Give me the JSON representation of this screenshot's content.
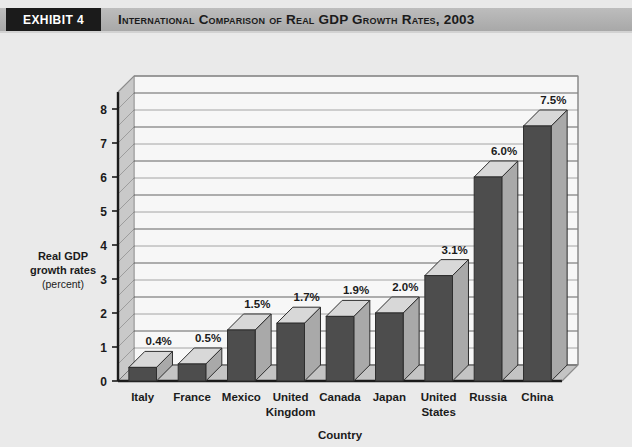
{
  "header": {
    "exhibit_label": "EXHIBIT 4",
    "title": "International Comparison of Real GDP Growth Rates, 2003"
  },
  "chart_data": {
    "type": "bar",
    "title": "International Comparison of Real GDP Growth Rates, 2003",
    "subtitle": "",
    "xlabel": "Country",
    "ylabel": "Real GDP growth rates",
    "ylabel_unit": "(percent)",
    "ylim": [
      0,
      8.5
    ],
    "yticks": [
      0,
      1,
      2,
      3,
      4,
      5,
      6,
      7,
      8
    ],
    "ytick_labels": [
      "0",
      "1",
      "2",
      "3",
      "4",
      "5",
      "6",
      "7",
      "8"
    ],
    "minor_gridline_step": 0.5,
    "grid": true,
    "legend": "none",
    "three_d": true,
    "categories": [
      "Italy",
      "France",
      "Mexico",
      "United Kingdom",
      "Canada",
      "Japan",
      "United States",
      "Russia",
      "China"
    ],
    "values": [
      0.4,
      0.5,
      1.5,
      1.7,
      1.9,
      2.0,
      3.1,
      6.0,
      7.5
    ],
    "data_labels": [
      "0.4%",
      "0.5%",
      "1.5%",
      "1.7%",
      "1.9%",
      "2.0%",
      "3.1%",
      "6.0%",
      "7.5%"
    ],
    "colors": {
      "bar_front": "#4d4d4d",
      "bar_top": "#d8d8d8",
      "bar_side": "#a9a9a9",
      "plot_background": "#f7f7f7",
      "side_wall": "#c9c9c9",
      "floor": "#c4c4c4",
      "gridline": "#4d4d4d",
      "axis": "#1b1b1b",
      "page_background": "#eaeaea",
      "header_bar": "#b3b3b3",
      "exhibit_tab": "#1b1b1b",
      "text": "#1b1b1b"
    }
  }
}
